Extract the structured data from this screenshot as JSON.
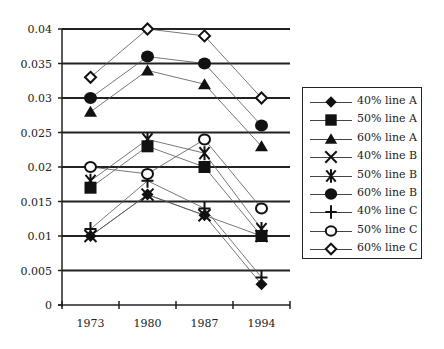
{
  "chart_data": {
    "type": "line",
    "title": "",
    "xlabel": "",
    "ylabel": "",
    "categories": [
      "1973",
      "1980",
      "1987",
      "1994"
    ],
    "ylim": [
      0,
      0.04
    ],
    "yticks": [
      "0",
      "0.005",
      "0.01",
      "0.015",
      "0.02",
      "0.025",
      "0.03",
      "0.035",
      "0.04"
    ],
    "grid": "horizontal",
    "legend_position": "right",
    "series": [
      {
        "name": "40% line A",
        "marker": "diamond-filled",
        "values": [
          0.01,
          0.016,
          0.013,
          0.003
        ]
      },
      {
        "name": "50% line A",
        "marker": "square-filled",
        "values": [
          0.017,
          0.023,
          0.02,
          0.01
        ]
      },
      {
        "name": "60% line A",
        "marker": "triangle-filled",
        "values": [
          0.028,
          0.034,
          0.032,
          0.023
        ]
      },
      {
        "name": "40% line B",
        "marker": "x",
        "values": [
          0.01,
          0.016,
          0.013,
          0.01
        ]
      },
      {
        "name": "50% line B",
        "marker": "asterisk",
        "values": [
          0.018,
          0.024,
          0.022,
          0.011
        ]
      },
      {
        "name": "60% line B",
        "marker": "circle-filled",
        "values": [
          0.03,
          0.036,
          0.035,
          0.026
        ]
      },
      {
        "name": "40% line C",
        "marker": "plus",
        "values": [
          0.011,
          0.018,
          0.014,
          0.004
        ]
      },
      {
        "name": "50% line C",
        "marker": "circle-open",
        "values": [
          0.02,
          0.019,
          0.024,
          0.014
        ]
      },
      {
        "name": "60% line C",
        "marker": "diamond-open",
        "values": [
          0.033,
          0.04,
          0.039,
          0.03
        ]
      }
    ]
  },
  "legend": {
    "items": [
      {
        "label": "40% line A",
        "marker": "diamond-filled"
      },
      {
        "label": "50% line A",
        "marker": "square-filled"
      },
      {
        "label": "60% line A",
        "marker": "triangle-filled"
      },
      {
        "label": "40% line B",
        "marker": "x"
      },
      {
        "label": "50% line B",
        "marker": "asterisk"
      },
      {
        "label": "60% line B",
        "marker": "circle-filled"
      },
      {
        "label": "40% line C",
        "marker": "plus"
      },
      {
        "label": "50% line C",
        "marker": "circle-open"
      },
      {
        "label": "60% line C",
        "marker": "diamond-open"
      }
    ]
  },
  "colors": {
    "ink": "#222222",
    "line": "#555555",
    "background": "#ffffff"
  }
}
